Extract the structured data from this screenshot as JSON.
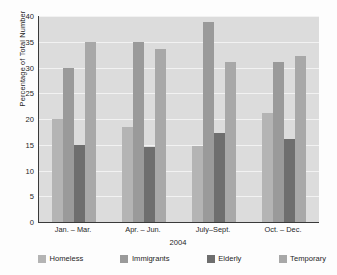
{
  "chart_data": {
    "type": "bar",
    "title": "",
    "subtitle": "",
    "xlabel": "2004",
    "ylabel": "Percentage of Total Number",
    "categories": [
      "Jan. – Mar.",
      "Apr. – Jun.",
      "July–Sept.",
      "Oct. – Dec."
    ],
    "series": [
      {
        "name": "Homeless",
        "color": "#b4b4b4",
        "values": [
          20.0,
          18.5,
          14.7,
          21.2
        ]
      },
      {
        "name": "Immigrants",
        "color": "#9a9a9a",
        "values": [
          29.9,
          35.0,
          38.8,
          31.0
        ]
      },
      {
        "name": "Elderly",
        "color": "#6e6e6e",
        "values": [
          15.0,
          14.6,
          17.3,
          16.2
        ]
      },
      {
        "name": "Temporary",
        "color": "#a8a8a8",
        "values": [
          35.0,
          33.5,
          31.0,
          32.2
        ]
      }
    ],
    "ylim": [
      0,
      40
    ],
    "yticks": [
      0,
      5,
      10,
      15,
      20,
      25,
      30,
      35,
      40
    ],
    "ytick_labels": [
      "0",
      "5",
      "10",
      "15",
      "20",
      "25",
      "30",
      "35",
      "40"
    ],
    "grid": true,
    "grid_axis": "y",
    "legend_position": "bottom",
    "plot_background": "#dcdcdc",
    "grid_color": "#f2f2f2",
    "axis_color": "#3a3a3a"
  }
}
